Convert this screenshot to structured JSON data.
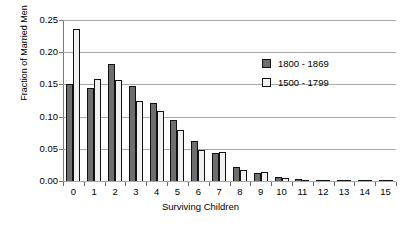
{
  "chart_data": {
    "type": "bar",
    "title": "",
    "xlabel": "Surviving Children",
    "ylabel": "Fraction of Married Men",
    "categories": [
      "0",
      "1",
      "2",
      "3",
      "4",
      "5",
      "6",
      "7",
      "8",
      "9",
      "10",
      "11",
      "12",
      "13",
      "14",
      "15"
    ],
    "ylim": [
      0,
      0.25
    ],
    "yticks": [
      "0.00",
      "0.05",
      "0.10",
      "0.15",
      "0.20",
      "0.25"
    ],
    "ytick_values": [
      0.0,
      0.05,
      0.1,
      0.15,
      0.2,
      0.25
    ],
    "grid": true,
    "legend_position": "upper right",
    "series": [
      {
        "name": "1800 - 1869",
        "color": "#6e6e6e",
        "values": [
          0.151,
          0.145,
          0.181,
          0.148,
          0.121,
          0.094,
          0.062,
          0.043,
          0.022,
          0.013,
          0.006,
          0.003,
          0.002,
          0.002,
          0.001,
          0.001
        ]
      },
      {
        "name": "1500 - 1799",
        "color": "#f0f0f0",
        "values": [
          0.236,
          0.159,
          0.157,
          0.124,
          0.108,
          0.079,
          0.048,
          0.045,
          0.017,
          0.014,
          0.005,
          0.002,
          0.002,
          0.001,
          0.001,
          0.001
        ]
      }
    ]
  },
  "legend": {
    "items": [
      {
        "label": "1800 - 1869",
        "style": "dark"
      },
      {
        "label": "1500 - 1799",
        "style": "light"
      }
    ]
  }
}
